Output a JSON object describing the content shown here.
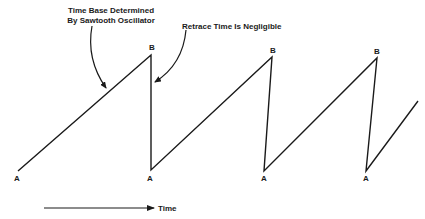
{
  "diagram": {
    "annotations": {
      "time_base_line1": "Time Base Determined",
      "time_base_line2": "By Sawtooth Oscillator",
      "retrace": "Retrace Time Is Negligible"
    },
    "axis": {
      "time_label": "Time"
    },
    "point_labels": {
      "a": "A",
      "b": "B"
    },
    "waveform": {
      "points": [
        {
          "label": "A",
          "x": 18,
          "y": 171
        },
        {
          "label": "B",
          "x": 151,
          "y": 55
        },
        {
          "label": "A",
          "x": 151,
          "y": 170
        },
        {
          "label": "B",
          "x": 272,
          "y": 57
        },
        {
          "label": "A",
          "x": 264,
          "y": 171
        },
        {
          "label": "B",
          "x": 377,
          "y": 58
        },
        {
          "label": "A",
          "x": 366,
          "y": 171
        },
        {
          "label": "",
          "x": 418,
          "y": 101
        }
      ]
    },
    "colors": {
      "stroke": "#1a1a1a",
      "background": "#ffffff"
    }
  }
}
